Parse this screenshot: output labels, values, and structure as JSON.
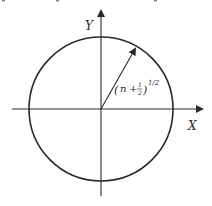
{
  "diagram": {
    "axes": {
      "x_label": "X",
      "y_label": "Y"
    },
    "circle": {
      "center": [
        101,
        109
      ],
      "radius": 72
    },
    "radius_vector": {
      "label_base": "(n + ",
      "label_frac_num": "1",
      "label_frac_den": "2",
      "label_close": ")",
      "label_exponent": "1/2"
    },
    "colors": {
      "stroke": "#2a2a2a",
      "background": "#ffffff"
    }
  }
}
